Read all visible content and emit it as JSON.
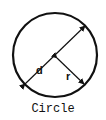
{
  "diagram": {
    "title": "Circle",
    "labels": {
      "diameter": "d",
      "radius": "r"
    },
    "colors": {
      "stroke": "#111111",
      "background": "#ffffff"
    }
  }
}
